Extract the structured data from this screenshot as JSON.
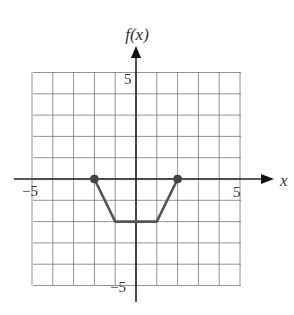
{
  "chart_data": {
    "type": "line",
    "title": "",
    "xlabel": "x",
    "ylabel": "f(x)",
    "xlim": [
      -5,
      5
    ],
    "ylim": [
      -5,
      5
    ],
    "grid": true,
    "x_tick_labels": [
      "-5",
      "5"
    ],
    "y_tick_labels": [
      "5",
      "-5"
    ],
    "series": [
      {
        "name": "f(x)",
        "x": [
          -2,
          -1,
          1,
          2
        ],
        "y": [
          0,
          -2,
          -2,
          0
        ],
        "endpoints": [
          {
            "x": -2,
            "y": 0,
            "style": "closed"
          },
          {
            "x": 2,
            "y": 0,
            "style": "closed"
          }
        ]
      }
    ],
    "colors": {
      "curve": "#555555",
      "grid": "#777777",
      "axis": "#222222"
    }
  },
  "labels": {
    "y_axis": "f(x)",
    "x_axis": "x",
    "x_min": "−5",
    "x_max": "5",
    "y_max": "5",
    "y_min": "−5"
  }
}
